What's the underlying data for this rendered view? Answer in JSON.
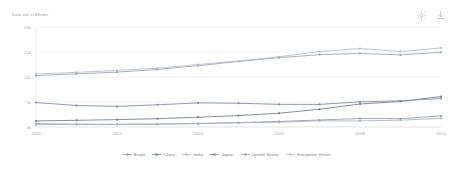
{
  "widget": {
    "axis_note": "Data are in billions",
    "toolbar": {
      "settings_label": "gear-icon",
      "download_label": "download-icon"
    }
  },
  "chart_data": {
    "type": "line",
    "title": "",
    "subtitle": "",
    "xlabel": "",
    "ylabel": "Data are in billions",
    "x": [
      2000,
      2001,
      2002,
      2003,
      2004,
      2005,
      2006,
      2007,
      2008,
      2009,
      2010
    ],
    "tick_x": [
      "2000",
      "2002",
      "2004",
      "2006",
      "2008",
      "2010"
    ],
    "tick_y": [
      "0k",
      "5k",
      "10k",
      "15k",
      "20k"
    ],
    "ylim": [
      0,
      20000
    ],
    "xlim": [
      2000,
      2010
    ],
    "grid": true,
    "legend_position": "bottom",
    "series": [
      {
        "name": "Brazil",
        "color": "#8d9aa8",
        "values": [
          655,
          560,
          510,
          558,
          669,
          892,
          1108,
          1397,
          1696,
          1667,
          2209
        ]
      },
      {
        "name": "China",
        "color": "#6e7b88",
        "values": [
          1211,
          1339,
          1471,
          1660,
          1955,
          2286,
          2752,
          3552,
          4598,
          5110,
          6087
        ]
      },
      {
        "name": "India",
        "color": "#a7b2bd",
        "values": [
          477,
          494,
          523,
          618,
          721,
          834,
          949,
          1239,
          1224,
          1365,
          1708
        ]
      },
      {
        "name": "Japan",
        "color": "#7d8a97",
        "values": [
          4888,
          4304,
          4115,
          4446,
          4816,
          4756,
          4530,
          4515,
          5038,
          5231,
          5700
        ]
      },
      {
        "name": "United States",
        "color": "#98a4b0",
        "values": [
          10285,
          10622,
          10978,
          11511,
          12275,
          13094,
          13856,
          14478,
          14719,
          14419,
          14964
        ]
      },
      {
        "name": "European Union",
        "color": "#b3bcc5",
        "values": [
          10600,
          10920,
          11320,
          11750,
          12500,
          13200,
          14050,
          15100,
          15700,
          15100,
          15800
        ]
      }
    ]
  }
}
